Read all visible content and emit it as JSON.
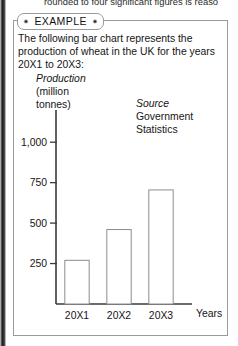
{
  "page": {
    "running_text_clipped": "rounded to four significant figures is reaso"
  },
  "example_box": {
    "tab_label": "EXAMPLE",
    "tab_star_left": "✷",
    "tab_star_right": "✷",
    "intro_text": "The following bar chart represents the production of wheat in the UK for the years 20X1 to 20X3:",
    "y_caption_line1": "Production",
    "y_caption_line2": "(million",
    "y_caption_line3": "tonnes)",
    "source_line1": "Source",
    "source_line2": "Government",
    "source_line3": "Statistics"
  },
  "chart_data": {
    "type": "bar",
    "title": "",
    "xlabel": "Years",
    "ylabel": "Production (million tonnes)",
    "categories": [
      "20X1",
      "20X2",
      "20X3"
    ],
    "values": [
      270,
      460,
      705
    ],
    "ytick_labels": [
      "250",
      "500",
      "750",
      "1,000"
    ],
    "ytick_values": [
      250,
      500,
      750,
      1000
    ],
    "ylim": [
      0,
      1100
    ],
    "grid": false,
    "legend": "none",
    "bar_fill": "#ffffff",
    "bar_stroke": "#8c8c8c",
    "axis_color": "#3a3a3a"
  }
}
